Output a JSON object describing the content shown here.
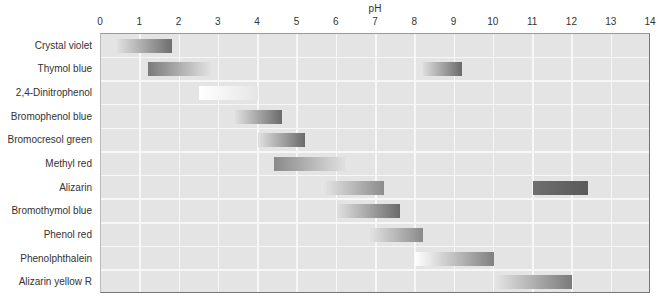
{
  "chart_data": {
    "type": "bar",
    "subtype": "horizontal range (gradient) chart",
    "title": "",
    "xlabel": "pH",
    "ylabel": "",
    "xlim": [
      0,
      14
    ],
    "x_ticks": [
      0,
      1,
      2,
      3,
      4,
      5,
      6,
      7,
      8,
      9,
      10,
      11,
      12,
      13,
      14
    ],
    "x_axis_position": "top",
    "grid": true,
    "legend": null,
    "categories": [
      "Crystal violet",
      "Thymol blue",
      "2,4-Dinitrophenol",
      "Bromophenol blue",
      "Bromocresol green",
      "Methyl red",
      "Alizarin",
      "Bromothymol blue",
      "Phenol red",
      "Phenolphthalein",
      "Alizarin yellow R"
    ],
    "ranges": [
      [
        {
          "start": 0.4,
          "end": 1.8,
          "from": "#e0e0e0",
          "to": "#6e6e6e",
          "fade": "right-dark"
        }
      ],
      [
        {
          "start": 1.2,
          "end": 2.8,
          "from": "#7a7a7a",
          "to": "#e2e2e2",
          "fade": "left-dark"
        },
        {
          "start": 8.2,
          "end": 9.2,
          "from": "#dddddd",
          "to": "#6a6a6a",
          "fade": "right-dark"
        }
      ],
      [
        {
          "start": 2.5,
          "end": 4.0,
          "from": "#ffffff",
          "to": "#e6e6e6",
          "fade": "left-white"
        }
      ],
      [
        {
          "start": 3.4,
          "end": 4.6,
          "from": "#e0e0e0",
          "to": "#6a6a6a",
          "fade": "right-dark"
        }
      ],
      [
        {
          "start": 4.0,
          "end": 5.2,
          "from": "#e0e0e0",
          "to": "#6a6a6a",
          "fade": "right-dark"
        }
      ],
      [
        {
          "start": 4.4,
          "end": 6.2,
          "from": "#8a8a8a",
          "to": "#e0e0e0",
          "fade": "left-dark"
        }
      ],
      [
        {
          "start": 5.6,
          "end": 7.2,
          "from": "#e8e8e8",
          "to": "#8c8c8c",
          "fade": "right-dark"
        },
        {
          "start": 11.0,
          "end": 12.4,
          "from": "#6e6e6e",
          "to": "#5a5a5a",
          "fade": "solid-dark"
        }
      ],
      [
        {
          "start": 6.0,
          "end": 7.6,
          "from": "#e0e0e0",
          "to": "#6a6a6a",
          "fade": "right-dark"
        }
      ],
      [
        {
          "start": 6.8,
          "end": 8.2,
          "from": "#e6e6e6",
          "to": "#8a8a8a",
          "fade": "right-dark"
        }
      ],
      [
        {
          "start": 8.0,
          "end": 10.0,
          "from": "#ffffff",
          "to": "#808080",
          "fade": "white-to-dark"
        }
      ],
      [
        {
          "start": 10.0,
          "end": 12.0,
          "from": "#e6e6e6",
          "to": "#7a7a7a",
          "fade": "right-dark"
        }
      ]
    ]
  }
}
